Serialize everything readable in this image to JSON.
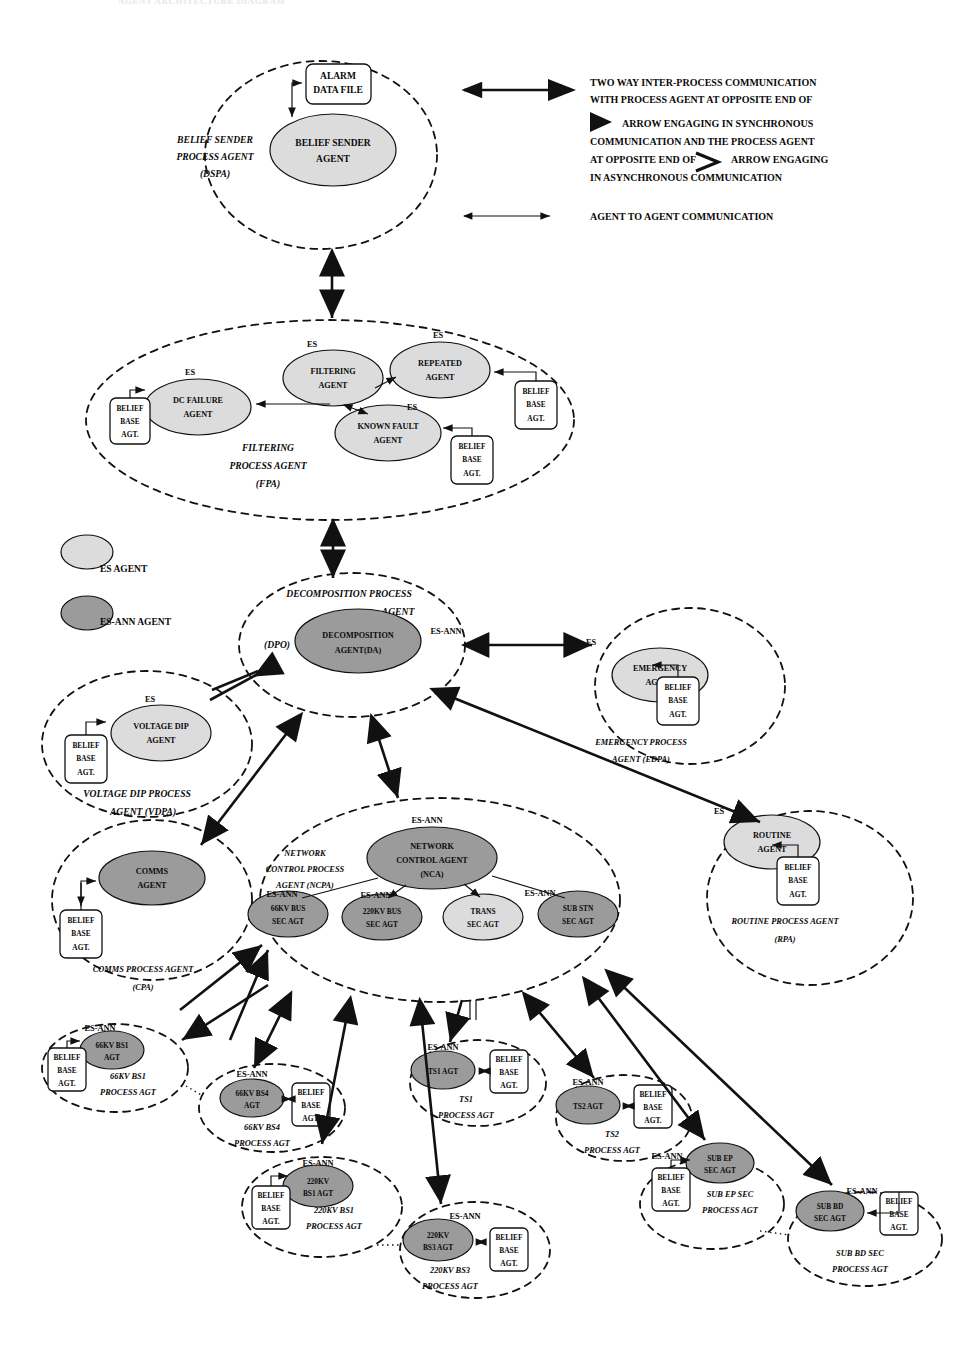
{
  "diagram": {
    "title_ghost": "AGENT ARCHITECTURE DIAGRAM",
    "legend": {
      "sync_async_text": [
        "TWO WAY INTER-PROCESS COMMUNICATION",
        "WITH PROCESS AGENT AT OPPOSITE END OF",
        "ARROW ENGAGING IN SYNCHRONOUS",
        "COMMUNICATION AND THE PROCESS AGENT",
        "AT OPPOSITE END OF",
        "ARROW ENGAGING",
        "IN ASYNCHRONOUS COMMUNICATION"
      ],
      "agent_to_agent": "AGENT TO AGENT COMMUNICATION",
      "key_es": "ES AGENT",
      "key_esann": "ES-ANN AGENT"
    },
    "colors": {
      "es_fill": "#dcdcdc",
      "es_ann_fill": "#9b9b9b",
      "stroke": "#111111",
      "background": "#ffffff"
    },
    "tags": {
      "es": "ES",
      "es_ann": "ES-ANN"
    },
    "belief_base": {
      "line1": "BELIEF",
      "line2": "BASE",
      "line3": "AGT."
    },
    "processes": [
      {
        "id": "dspa",
        "name_lines": [
          "BELIEF SENDER",
          "PROCESS AGENT",
          "(DSPA)"
        ],
        "agents": [
          {
            "id": "belief-sender-agent",
            "lines": [
              "BELIEF SENDER",
              "AGENT"
            ],
            "type": "es"
          }
        ],
        "file": {
          "lines": [
            "ALARM",
            "DATA FILE"
          ]
        }
      },
      {
        "id": "fpa",
        "name_lines": [
          "FILTERING",
          "PROCESS AGENT",
          "(FPA)"
        ],
        "agents": [
          {
            "id": "dc-failure-agent",
            "lines": [
              "DC FAILURE",
              "AGENT"
            ],
            "type": "es",
            "tag": "ES"
          },
          {
            "id": "filtering-agent",
            "lines": [
              "FILTERING",
              "AGENT"
            ],
            "type": "es",
            "tag": "ES"
          },
          {
            "id": "repeated-agent",
            "lines": [
              "REPEATED",
              "AGENT"
            ],
            "type": "es",
            "tag": "ES"
          },
          {
            "id": "known-fault-agent",
            "lines": [
              "KNOWN FAULT",
              "AGENT"
            ],
            "type": "es",
            "tag": "ES"
          }
        ]
      },
      {
        "id": "dpo",
        "name_lines": [
          "DECOMPOSITION PROCESS",
          "AGENT"
        ],
        "code": "(DPO)",
        "agents": [
          {
            "id": "decomposition-agent",
            "lines": [
              "DECOMPOSITION",
              "AGENT(DA)"
            ],
            "type": "es-ann",
            "tag": "ES-ANN"
          }
        ]
      },
      {
        "id": "vdpa",
        "name_lines": [
          "VOLTAGE DIP  PROCESS",
          "AGENT (VDPA)"
        ],
        "agents": [
          {
            "id": "voltage-dip-agent",
            "lines": [
              "VOLTAGE DIP",
              "AGENT"
            ],
            "type": "es",
            "tag": "ES"
          }
        ]
      },
      {
        "id": "edpa",
        "name_lines": [
          "EMERGENCY PROCESS",
          "AGENT (EDPA)"
        ],
        "agents": [
          {
            "id": "emergency-agent",
            "lines": [
              "EMERGENCY",
              "AGENT"
            ],
            "type": "es",
            "tag": "ES"
          }
        ]
      },
      {
        "id": "cpa",
        "name_lines": [
          "COMMS PROCESS  AGENT",
          "(CPA)"
        ],
        "agents": [
          {
            "id": "comms-agent",
            "lines": [
              "COMMS",
              "AGENT"
            ],
            "type": "es-ann"
          }
        ]
      },
      {
        "id": "rpa",
        "name_lines": [
          "ROUTINE  PROCESS AGENT",
          "(RPA)"
        ],
        "agents": [
          {
            "id": "routine-agent",
            "lines": [
              "ROUTINE",
              "AGENT"
            ],
            "type": "es",
            "tag": "ES"
          }
        ]
      },
      {
        "id": "ncpa",
        "name_lines": [
          "NETWORK",
          "CONTROL PROCESS",
          "AGENT (NCPA)"
        ],
        "agents": [
          {
            "id": "network-control-agent",
            "lines": [
              "NETWORK",
              "CONTROL AGENT",
              "(NCA)"
            ],
            "type": "es-ann",
            "tag": "ES-ANN"
          },
          {
            "id": "66kv-bus-sec-agt",
            "lines": [
              "66KV BUS",
              "SEC AGT"
            ],
            "type": "es-ann",
            "tag": "ES-ANN"
          },
          {
            "id": "220kv-bus-sec-agt",
            "lines": [
              "220KV BUS",
              "SEC AGT"
            ],
            "type": "es-ann",
            "tag": "ES-ANN"
          },
          {
            "id": "trans-sec-agt",
            "lines": [
              "TRANS",
              "SEC AGT"
            ],
            "type": "es"
          },
          {
            "id": "sub-stn-sec-agt",
            "lines": [
              "SUB STN",
              "SEC AGT"
            ],
            "type": "es-ann",
            "tag": "ES-ANN"
          }
        ]
      },
      {
        "id": "66kv-bs1",
        "name_lines": [
          "66KV BS1",
          "PROCESS AGT"
        ],
        "agents": [
          {
            "id": "66kv-bs1-agt",
            "lines": [
              "66KV BS1",
              "AGT"
            ],
            "type": "es-ann",
            "tag": "ES-ANN"
          }
        ]
      },
      {
        "id": "66kv-bs4",
        "name_lines": [
          "66KV BS4",
          "PROCESS AGT"
        ],
        "agents": [
          {
            "id": "66kv-bs4-agt",
            "lines": [
              "66KV BS4",
              "AGT"
            ],
            "type": "es-ann",
            "tag": "ES-ANN"
          }
        ]
      },
      {
        "id": "ts1",
        "name_lines": [
          "TS1",
          "PROCESS AGT"
        ],
        "agents": [
          {
            "id": "ts1-agt",
            "lines": [
              "TS1 AGT"
            ],
            "type": "es-ann",
            "tag": "ES-ANN"
          }
        ]
      },
      {
        "id": "ts2",
        "name_lines": [
          "TS2",
          "PROCESS AGT"
        ],
        "agents": [
          {
            "id": "ts2-agt",
            "lines": [
              "TS2 AGT"
            ],
            "type": "es-ann",
            "tag": "ES-ANN"
          }
        ]
      },
      {
        "id": "220kv-bs1",
        "name_lines": [
          "220KV BS1",
          "PROCESS AGT"
        ],
        "agents": [
          {
            "id": "220kv-bs1-agt",
            "lines": [
              "220KV",
              "BS1 AGT"
            ],
            "type": "es-ann",
            "tag": "ES-ANN"
          }
        ]
      },
      {
        "id": "220kv-bs3",
        "name_lines": [
          "220KV BS3",
          "PROCESS AGT"
        ],
        "agents": [
          {
            "id": "220kv-bs3-agt",
            "lines": [
              "220KV",
              "BS3 AGT"
            ],
            "type": "es-ann",
            "tag": "ES-ANN"
          }
        ]
      },
      {
        "id": "sub-ep-sec",
        "name_lines": [
          "SUB EP SEC",
          "PROCESS AGT"
        ],
        "agents": [
          {
            "id": "sub-ep-sec-agt",
            "lines": [
              "SUB EP",
              "SEC AGT"
            ],
            "type": "es-ann",
            "tag": "ES-ANN"
          }
        ]
      },
      {
        "id": "sub-bd-sec",
        "name_lines": [
          "SUB BD SEC",
          "PROCESS AGT"
        ],
        "agents": [
          {
            "id": "sub-bd-sec-agt",
            "lines": [
              "SUB BD",
              "SEC AGT"
            ],
            "type": "es-ann",
            "tag": "ES-ANN"
          }
        ]
      }
    ]
  }
}
